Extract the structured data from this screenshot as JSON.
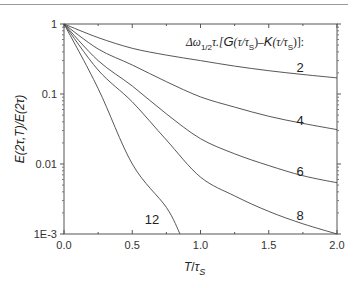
{
  "chart_data": {
    "type": "line",
    "title": "",
    "legend_title": "Δω1/2τ.[G(τ/τs)–K(τ/τs)]:",
    "xlabel": "T/τs",
    "ylabel": "E(2τ,T)/E(2τ)",
    "xlim": [
      0.0,
      2.0
    ],
    "ylim": [
      0.001,
      1
    ],
    "yscale": "log",
    "x_ticks": [
      "0.0",
      "0.5",
      "1.0",
      "1.5",
      "2.0"
    ],
    "y_ticks": [
      "1E-3",
      "0.01",
      "0.1",
      "1"
    ],
    "grid": false,
    "x": [
      0.0,
      0.25,
      0.5,
      0.75,
      1.0,
      1.25,
      1.5,
      1.75,
      2.0
    ],
    "series": [
      {
        "name": "2",
        "values": [
          1.0,
          0.64,
          0.45,
          0.36,
          0.3,
          0.25,
          0.215,
          0.19,
          0.17
        ]
      },
      {
        "name": "4",
        "values": [
          1.0,
          0.44,
          0.26,
          0.15,
          0.091,
          0.065,
          0.048,
          0.038,
          0.031
        ]
      },
      {
        "name": "6",
        "values": [
          1.0,
          0.3,
          0.13,
          0.052,
          0.023,
          0.014,
          0.0095,
          0.0068,
          0.0054
        ]
      },
      {
        "name": "8",
        "values": [
          1.0,
          0.22,
          0.077,
          0.022,
          0.0065,
          0.0035,
          0.0021,
          0.0014,
          0.001
        ]
      },
      {
        "name": "12",
        "values": [
          1.0,
          0.12,
          0.01,
          0.0024,
          null,
          null,
          null,
          null,
          null
        ],
        "end_x": 0.85
      }
    ]
  },
  "axes": {
    "xlabel_main": "T",
    "xlabel_slash": "/",
    "xlabel_tau": "τ",
    "xlabel_sub": "S",
    "ylabel": "E(2τ,T)/E(2τ)"
  },
  "legend": {
    "prefix": "Δω",
    "sub": "1/2",
    "tau": "τ.[",
    "G": "G",
    "paren1": "(τ/τ",
    "s1": "S",
    "mid": ")–",
    "K": "K",
    "paren2": "(τ/τ",
    "s2": "S",
    "end": ")]:"
  },
  "curve_labels": [
    "2",
    "4",
    "6",
    "8",
    "12"
  ]
}
